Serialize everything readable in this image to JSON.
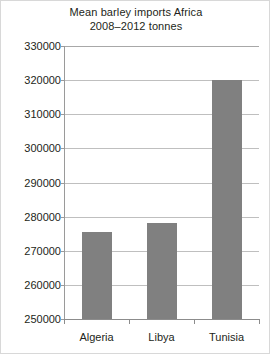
{
  "chart_data": {
    "type": "bar",
    "title": "Mean barley imports Africa 2008–2012 tonnes",
    "title_lines": [
      "Mean barley imports Africa",
      "2008–2012 tonnes"
    ],
    "categories": [
      "Algeria",
      "Libya",
      "Tunisia"
    ],
    "values": [
      275500,
      278200,
      320000
    ],
    "xlabel": "",
    "ylabel": "",
    "ylim": [
      250000,
      330000
    ],
    "ytick_step": 10000,
    "yticks": [
      330000,
      320000,
      310000,
      300000,
      290000,
      280000,
      270000,
      260000,
      250000
    ],
    "ytick_labels": [
      "330000",
      "320000",
      "310000",
      "300000",
      "290000",
      "280000",
      "270000",
      "260000",
      "250000"
    ],
    "grid": true,
    "grid_axis": "y",
    "legend": false,
    "bar_color": "#808080",
    "gridline_color": "#bfbfbf",
    "axis_color": "#8c8c8c",
    "text_color": "#231f20",
    "background_color": "#ffffff"
  }
}
